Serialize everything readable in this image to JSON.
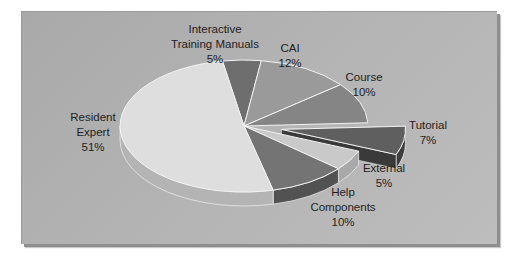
{
  "chart_data": {
    "type": "pie",
    "style": "3d-exploded",
    "title": "",
    "slices": [
      {
        "label": "Interactive Training Manuals",
        "value": 5,
        "display": "5%",
        "color": "#6e6e6e",
        "side": "#4e4e4e"
      },
      {
        "label": "CAI",
        "value": 12,
        "display": "12%",
        "color": "#9a9a9a",
        "side": "#7d7d7d"
      },
      {
        "label": "Course",
        "value": 10,
        "display": "10%",
        "color": "#858585",
        "side": "#676767"
      },
      {
        "label": "Tutorial",
        "value": 7,
        "display": "7%",
        "color": "#5f5f5f",
        "side": "#3e3e3e",
        "exploded": true
      },
      {
        "label": "External",
        "value": 5,
        "display": "5%",
        "color": "#c9c9c9",
        "side": "#a9a9a9"
      },
      {
        "label": "Help Components",
        "value": 10,
        "display": "10%",
        "color": "#747474",
        "side": "#525252"
      },
      {
        "label": "Resident Expert",
        "value": 51,
        "display": "51%",
        "color": "#dedede",
        "side": "#b4b4b4"
      }
    ],
    "legend": "none",
    "labels_position": "outside"
  },
  "labels": {
    "itm": [
      "Interactive",
      "Training Manuals",
      "5%"
    ],
    "cai": [
      "CAI",
      "12%"
    ],
    "course": [
      "Course",
      "10%"
    ],
    "tutorial": [
      "Tutorial",
      "7%"
    ],
    "external": [
      "External",
      "5%"
    ],
    "help": [
      "Help",
      "Components",
      "10%"
    ],
    "resident": [
      "Resident",
      "Expert",
      "51%"
    ]
  }
}
